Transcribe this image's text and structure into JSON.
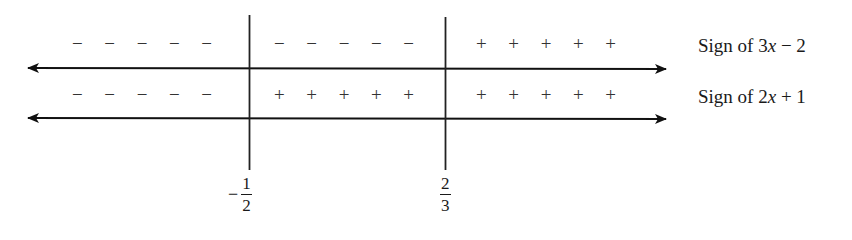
{
  "diagram": {
    "type": "sign-chart",
    "critical_points": [
      {
        "label_sign": "−",
        "numerator": "1",
        "denominator": "2",
        "value": -0.5
      },
      {
        "label_sign": "",
        "numerator": "2",
        "denominator": "3",
        "value": 0.6667
      }
    ],
    "rows": [
      {
        "label_prefix": "Sign of 3",
        "label_var": "x",
        "label_suffix": " − 2",
        "intervals": [
          "− − − − −",
          "− − − − −",
          "+ + + + +"
        ]
      },
      {
        "label_prefix": "Sign of 2",
        "label_var": "x",
        "label_suffix": " + 1",
        "intervals": [
          "− − − − −",
          "+ + + + +",
          "+ + + + +"
        ]
      }
    ]
  }
}
